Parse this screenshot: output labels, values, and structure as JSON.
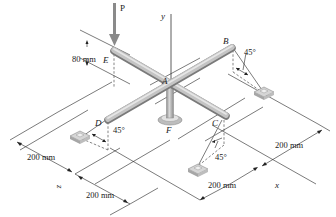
{
  "figure": {
    "type": "statics-3d-frame"
  },
  "labels": {
    "load": "P",
    "y_axis": "y",
    "x_axis": "x",
    "z_axis": "z",
    "A": "A",
    "B": "B",
    "C": "C",
    "D": "D",
    "E": "E",
    "F": "F"
  },
  "dimensions": {
    "height_E": "80 mm",
    "left_front": "200 mm",
    "bottom_z": "200 mm",
    "bottom_x": "200 mm",
    "right_x": "200 mm"
  },
  "angles": {
    "B": "45°",
    "C": "45°",
    "D": "45°"
  },
  "colors": {
    "bar": "#a9a9a9",
    "bar_highlight": "#dcdcdc",
    "line": "#222222",
    "anchor": "#c8c8c8"
  }
}
